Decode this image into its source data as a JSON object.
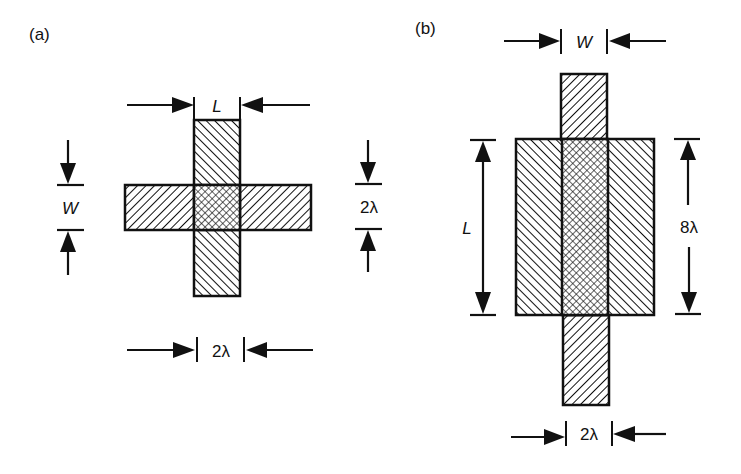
{
  "figure": {
    "panel_a": {
      "label": "(a)",
      "dims": {
        "top": "L",
        "left": "W",
        "right": "2λ",
        "bottom": "2λ"
      }
    },
    "panel_b": {
      "label": "(b)",
      "dims": {
        "top": "W",
        "left": "L",
        "right": "8λ",
        "bottom": "2λ"
      }
    },
    "colors": {
      "stroke": "#111111",
      "background": "#ffffff"
    }
  }
}
